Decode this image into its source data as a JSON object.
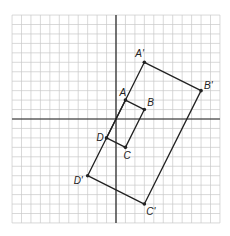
{
  "grid": {
    "cell": 9.45,
    "origin_px": [
      116,
      119
    ],
    "x_range": [
      -11,
      11
    ],
    "y_range": [
      -11,
      11
    ],
    "line_color": "#c8c8c8",
    "axis_color": "#222222"
  },
  "figures": [
    {
      "name": "ABCD",
      "points": [
        {
          "label": "A",
          "x": 1,
          "y": 2,
          "label_dx": -6,
          "label_dy": -4
        },
        {
          "label": "B",
          "x": 3,
          "y": 1,
          "label_dx": 3,
          "label_dy": -4
        },
        {
          "label": "C",
          "x": 1,
          "y": -3,
          "label_dx": -2,
          "label_dy": 12
        },
        {
          "label": "D",
          "x": -1,
          "y": -2,
          "label_dx": -10,
          "label_dy": 3
        }
      ]
    },
    {
      "name": "A'B'C'D'",
      "points": [
        {
          "label": "A'",
          "x": 3,
          "y": 6,
          "label_dx": -9,
          "label_dy": -5
        },
        {
          "label": "B'",
          "x": 9,
          "y": 3,
          "label_dx": 3,
          "label_dy": -2
        },
        {
          "label": "C'",
          "x": 3,
          "y": -9,
          "label_dx": 2,
          "label_dy": 11
        },
        {
          "label": "D'",
          "x": -3,
          "y": -6,
          "label_dx": -14,
          "label_dy": 8
        }
      ]
    }
  ]
}
